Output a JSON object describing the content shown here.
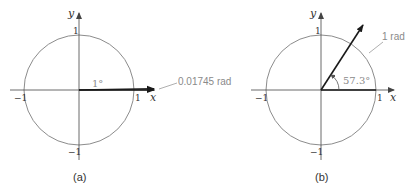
{
  "colors": {
    "circle": "#8c8c8c",
    "axis": "#444444",
    "vector": "#1a1a1a",
    "callout": "#9a9a9a",
    "callout_text": "#8a8a8a",
    "background": "#ffffff"
  },
  "panels": [
    {
      "id": "a",
      "caption": "(a)",
      "x_axis_label": "x",
      "y_axis_label": "y",
      "ticks": {
        "x_pos": "1",
        "x_neg": "−1",
        "y_pos": "1",
        "y_neg": "−1"
      },
      "angle_label": "1°",
      "arc_label": "0.01745 rad",
      "angle_degrees": 1
    },
    {
      "id": "b",
      "caption": "(b)",
      "x_axis_label": "x",
      "y_axis_label": "y",
      "ticks": {
        "x_pos": "1",
        "x_neg": "−1",
        "y_pos": "1",
        "y_neg": "−1"
      },
      "angle_label": "57.3°",
      "arc_label": "1 rad",
      "angle_degrees": 57.3
    }
  ]
}
